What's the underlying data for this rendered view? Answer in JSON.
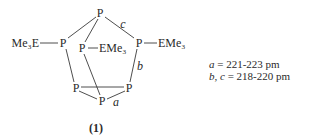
{
  "structure": {
    "atoms": {
      "p_top": "P",
      "p_left": "P",
      "p_inner": "P",
      "p_right": "P",
      "p_bottom_left": "P",
      "p_bottom_right": "P",
      "p_bottom": "P"
    },
    "substituents": {
      "left": "Me₃E",
      "inner": "EMe₃",
      "right": "EMe₃"
    },
    "bond_labels": {
      "a": "a",
      "b": "b",
      "c": "c"
    }
  },
  "legend": {
    "line1_var": "a",
    "line1_value": " = 221-223 pm",
    "line2_var1": "b",
    "line2_sep": ", ",
    "line2_var2": "c",
    "line2_value": " = 218-220 pm"
  },
  "caption": "(1)"
}
